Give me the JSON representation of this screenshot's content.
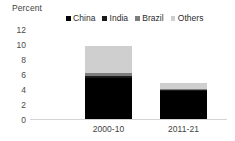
{
  "chart_data": {
    "type": "bar",
    "stacked": true,
    "title": "",
    "subtitle": "",
    "xlabel": "",
    "ylabel": "Percent",
    "categories": [
      "2000-10",
      "2011-21"
    ],
    "series": [
      {
        "name": "China",
        "color": "#000000",
        "values": [
          5.5,
          3.7
        ]
      },
      {
        "name": "India",
        "color": "#1a1a1a",
        "values": [
          0.3,
          0.15
        ]
      },
      {
        "name": "Brazil",
        "color": "#7d7d7d",
        "values": [
          0.35,
          0.15
        ]
      },
      {
        "name": "Others",
        "color": "#cfcfcf",
        "values": [
          3.65,
          0.8
        ]
      }
    ],
    "totals": [
      9.8,
      4.8
    ],
    "yticks": [
      0,
      2,
      4,
      6,
      8,
      10,
      12
    ],
    "ylim": [
      0,
      12
    ],
    "grid": false,
    "legend_position": "top-center",
    "legend_entries": [
      "China",
      "India",
      "Brazil",
      "Others"
    ]
  },
  "axis": {
    "y_title": "Percent"
  },
  "colors": {
    "background": "#ffffff",
    "baseline": "#d4d4d4",
    "tick_text": "#4a4a4a",
    "label_text": "#3f3f3f"
  }
}
